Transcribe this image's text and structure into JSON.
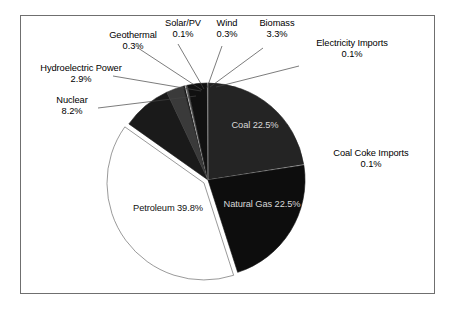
{
  "figure": {
    "border_color": "#6f6f6f",
    "background": "#ffffff"
  },
  "chart_data": {
    "type": "pie",
    "title": "",
    "xlabel": "",
    "ylabel": "",
    "legend_position": "none",
    "grid": false,
    "value_unit": "%",
    "start_angle_deg": 90,
    "direction": "clockwise",
    "categories": [
      "Coal",
      "Coal Coke Imports",
      "Natural Gas",
      "Petroleum",
      "Nuclear",
      "Hydroelectric Power",
      "Geothermal",
      "Solar/PV",
      "Wind",
      "Biomass",
      "Electricity Imports"
    ],
    "values": [
      22.5,
      0.1,
      22.5,
      39.8,
      8.2,
      2.9,
      0.3,
      0.1,
      0.3,
      3.3,
      0.1
    ],
    "value_labels": [
      "22.5%",
      "0.1%",
      "22.5%",
      "39.8%",
      "8.2%",
      "2.9%",
      "0.3%",
      "0.1%",
      "0.3%",
      "3.3%",
      "0.1%"
    ],
    "slice_colors": [
      "#242424",
      "#c9c9c9",
      "#0d0d0d",
      "#ffffff",
      "#1a1a1a",
      "#3a3a3a",
      "#161616",
      "#e8e8e8",
      "#555555",
      "#111111",
      "#8a8a8a"
    ]
  },
  "slices": {
    "coal": {
      "label": "Coal",
      "value": "22.5%"
    },
    "coal_coke_imports": {
      "label": "Coal Coke Imports",
      "value": "0.1%"
    },
    "natural_gas": {
      "label": "Natural Gas",
      "value": "22.5%"
    },
    "petroleum": {
      "label": "Petroleum",
      "value": "39.8%"
    },
    "nuclear": {
      "label": "Nuclear",
      "value": "8.2%"
    },
    "hydroelectric_power": {
      "label": "Hydroelectric Power",
      "value": "2.9%"
    },
    "geothermal": {
      "label": "Geothermal",
      "value": "0.3%"
    },
    "solar_pv": {
      "label": "Solar/PV",
      "value": "0.1%"
    },
    "wind": {
      "label": "Wind",
      "value": "0.3%"
    },
    "biomass": {
      "label": "Biomass",
      "value": "3.3%"
    },
    "electricity_imports": {
      "label": "Electricity Imports",
      "value": "0.1%"
    }
  }
}
